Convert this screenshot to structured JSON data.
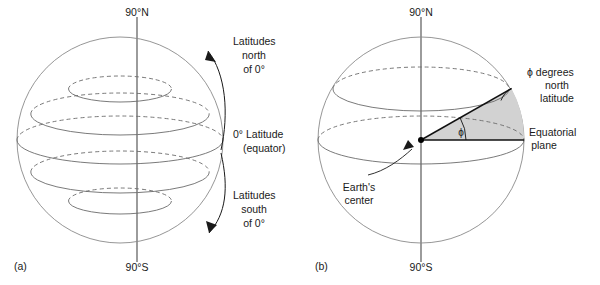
{
  "figure": {
    "colors": {
      "sphere_outline": "#8a8a8a",
      "latitude_line": "#6b6b6b",
      "axis": "#4a4a4a",
      "wedge_fill": "#d2d2d2",
      "text": "#1a1a1a"
    }
  },
  "panel_a": {
    "id": "(a)",
    "pole_north": "90°N",
    "pole_south": "90°S",
    "annotations": {
      "north": "Latitudes\nnorth\nof 0°",
      "north_line1": "Latitudes",
      "north_line2": "north",
      "north_line3": "of 0°",
      "equator_line1": "0° Latitude",
      "equator_line2": "(equator)",
      "south_line1": "Latitudes",
      "south_line2": "south",
      "south_line3": "of 0°"
    },
    "latitude_circles": [
      {
        "label": "60°N",
        "value": 60
      },
      {
        "label": "30°N",
        "value": 30
      },
      {
        "label": "0° (equator)",
        "value": 0
      },
      {
        "label": "30°S",
        "value": -30
      },
      {
        "label": "60°S",
        "value": -60
      }
    ]
  },
  "panel_b": {
    "id": "(b)",
    "pole_north": "90°N",
    "pole_south": "90°S",
    "annotations": {
      "phi_line1": "ϕ degrees",
      "phi_line2": "north",
      "phi_line3": "latitude",
      "equatorial_line1": "Equatorial",
      "equatorial_line2": "plane",
      "center_line1": "Earth's",
      "center_line2": "center",
      "angle_symbol": "ϕ"
    },
    "latitude_circles": [
      {
        "label": "60°N",
        "value": 60
      },
      {
        "label": "0° (equator)",
        "value": 0
      }
    ]
  }
}
